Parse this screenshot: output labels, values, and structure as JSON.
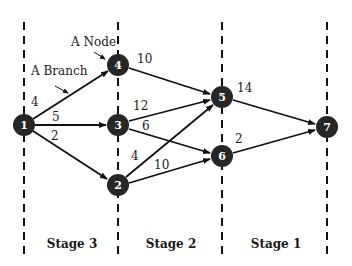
{
  "diagram": {
    "annotations": {
      "node_label": "A Node",
      "branch_label": "A Branch"
    },
    "stages": [
      {
        "label": "Stage 3"
      },
      {
        "label": "Stage 2"
      },
      {
        "label": "Stage 1"
      }
    ],
    "nodes": [
      {
        "id": "1",
        "label": "1",
        "x": 24,
        "y": 125
      },
      {
        "id": "2",
        "label": "2",
        "x": 118,
        "y": 185
      },
      {
        "id": "3",
        "label": "3",
        "x": 118,
        "y": 125
      },
      {
        "id": "4",
        "label": "4",
        "x": 118,
        "y": 65
      },
      {
        "id": "5",
        "label": "5",
        "x": 222,
        "y": 97
      },
      {
        "id": "6",
        "label": "6",
        "x": 222,
        "y": 156
      },
      {
        "id": "7",
        "label": "7",
        "x": 327,
        "y": 127
      }
    ],
    "edges": [
      {
        "from": "1",
        "to": "4",
        "weight": "4"
      },
      {
        "from": "1",
        "to": "3",
        "weight": "5"
      },
      {
        "from": "1",
        "to": "2",
        "weight": "2"
      },
      {
        "from": "4",
        "to": "5",
        "weight": "10"
      },
      {
        "from": "3",
        "to": "5",
        "weight": "12"
      },
      {
        "from": "3",
        "to": "6",
        "weight": "6"
      },
      {
        "from": "2",
        "to": "5",
        "weight": "4"
      },
      {
        "from": "2",
        "to": "6",
        "weight": "10"
      },
      {
        "from": "5",
        "to": "7",
        "weight": "14"
      },
      {
        "from": "6",
        "to": "7",
        "weight": "2"
      }
    ],
    "colors": {
      "node_fill": "#262626",
      "line": "#111111",
      "node_text": "#ffffff"
    }
  }
}
